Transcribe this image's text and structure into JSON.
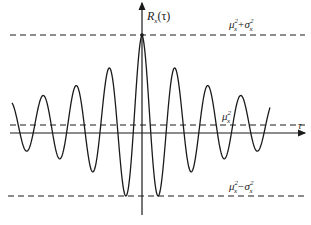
{
  "diagram": {
    "y_axis_label": "R_x(τ)",
    "x_axis_label": "τ",
    "levels": [
      {
        "name": "upper",
        "label": "μx²+σx²",
        "y_px": 35
      },
      {
        "name": "mean",
        "label": "μx²",
        "y_px": 125
      },
      {
        "name": "lower",
        "label": "μx²−σx²",
        "y_px": 196
      }
    ],
    "labels": {
      "ylabel_main": "R",
      "ylabel_sub": "x",
      "ylabel_arg": "(τ)",
      "xlabel": "τ",
      "upper_mu": "μ",
      "upper_plus": "+σ",
      "mean_mu": "μ",
      "lower_mu": "μ",
      "lower_minus": "−σ",
      "sup2": "2",
      "subx": "x"
    },
    "colors": {
      "line": "#1a1a1a",
      "background": "#ffffff"
    }
  }
}
